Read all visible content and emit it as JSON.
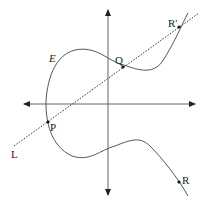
{
  "diagram": {
    "curve_label": "E",
    "line_label": "L",
    "points": [
      {
        "name": "P",
        "label": "P"
      },
      {
        "name": "Q",
        "label": "Q"
      },
      {
        "name": "R'",
        "label": "R'"
      },
      {
        "name": "R",
        "label": "R"
      }
    ],
    "colors": {
      "stroke": "#555555",
      "text": "#222222",
      "point": "#111111"
    }
  }
}
